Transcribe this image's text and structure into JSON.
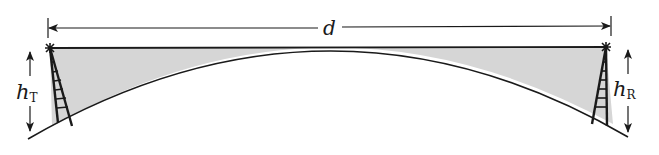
{
  "diagram": {
    "labels": {
      "distance": "d",
      "transmitter_height_symbol": "h",
      "transmitter_height_subscript": "T",
      "receiver_height_symbol": "h",
      "receiver_height_subscript": "R"
    },
    "colors": {
      "stroke": "#1a1a1a",
      "shaded_region": "#d6d6d6",
      "background": "#ffffff"
    },
    "elements": {
      "distance_arrow": {
        "from_x": 48,
        "to_x": 611,
        "y": 28
      },
      "line_of_sight": {
        "from": [
          50,
          48
        ],
        "to": [
          606,
          47
        ]
      },
      "earth_surface": {
        "left": [
          28,
          139
        ],
        "apex": [
          330,
          53
        ],
        "right": [
          628,
          137
        ]
      },
      "transmitter_tower": {
        "top": [
          50,
          48
        ],
        "base_left": [
          58,
          123
        ],
        "base_right": [
          72,
          126
        ]
      },
      "receiver_tower": {
        "top": [
          606,
          47
        ],
        "base_left": [
          592,
          124
        ],
        "base_right": [
          607,
          126
        ]
      },
      "transmitter_height_arrow": {
        "x": 30,
        "top_y": 52,
        "bottom_y": 131
      },
      "receiver_height_arrow": {
        "x": 628,
        "top_y": 50,
        "bottom_y": 132
      }
    }
  }
}
